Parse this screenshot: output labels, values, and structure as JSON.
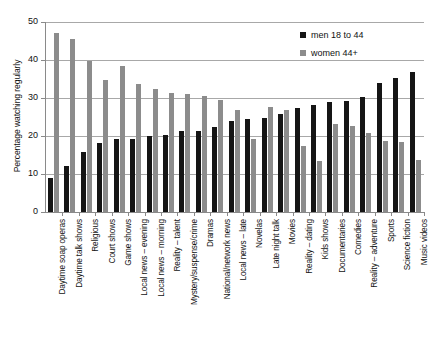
{
  "chart_data": {
    "type": "bar",
    "title": "",
    "subtitle": "",
    "xlabel": "",
    "ylabel": "Percentage watching regularly",
    "ylim": [
      0,
      50
    ],
    "yticks": [
      0,
      10,
      20,
      30,
      40,
      50
    ],
    "grid": "horizontal",
    "legend_position": "top-right",
    "orientation": "vertical",
    "categories": [
      "Daytime soap operas",
      "Daytime talk shows",
      "Religious",
      "Court shows",
      "Game shows",
      "Local news – evening",
      "Local news – morning",
      "Reality – talent",
      "Mystery/suspense/crime",
      "Dramas",
      "National/network news",
      "Local news – late",
      "Novelas",
      "Late night talk",
      "Movies",
      "Reality – dating",
      "Kids shows",
      "Documentaries",
      "Comedies",
      "Reality – adventure",
      "Sports",
      "Science fiction",
      "Music videos"
    ],
    "series": [
      {
        "name": "men 18 to 44",
        "color": "#151515",
        "values": [
          9,
          12.2,
          15.7,
          18.1,
          19.2,
          19.3,
          20.0,
          20.2,
          21.3,
          21.4,
          22.5,
          24.0,
          24.4,
          24.8,
          25.8,
          27.4,
          28.2,
          28.9,
          29.2,
          30.2,
          34.0,
          35.2,
          36.8
        ]
      },
      {
        "name": "women 44+",
        "color": "#8c8c8c",
        "values": [
          47.0,
          45.4,
          39.8,
          34.7,
          38.4,
          33.6,
          32.3,
          31.4,
          31.0,
          30.5,
          29.4,
          26.9,
          19.2,
          27.7,
          26.8,
          17.3,
          13.5,
          23.2,
          22.7,
          20.9,
          18.7,
          18.4,
          13.8
        ]
      }
    ]
  },
  "legend": {
    "entries": [
      {
        "label": "men 18 to 44",
        "swatch": "black-square-swatch"
      },
      {
        "label": "women 44+",
        "swatch": "gray-square-swatch"
      }
    ]
  },
  "axis": {
    "y_title": "Percentage watching regularly",
    "y_tick_labels": [
      "0",
      "10",
      "20",
      "30",
      "40",
      "50"
    ]
  },
  "colors": {
    "men_bar": "#151515",
    "women_bar": "#8c8c8c",
    "gridline": "#a8a8a8",
    "axis": "#8a8a8a",
    "background": "#ffffff",
    "text": "#111111"
  }
}
